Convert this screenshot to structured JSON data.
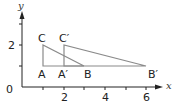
{
  "diagram": {
    "type": "coordinate-geometry",
    "axes": {
      "x_label": "x",
      "y_label": "y",
      "origin_label": "0",
      "x_ticks": [
        "2",
        "4",
        "6"
      ],
      "y_ticks": [
        "2"
      ]
    },
    "points": {
      "A": {
        "label": "A",
        "x": 1,
        "y": 1
      },
      "B": {
        "label": "B",
        "x": 3,
        "y": 1
      },
      "C": {
        "label": "C",
        "x": 1,
        "y": 2
      },
      "A_prime": {
        "label": "A′",
        "x": 2,
        "y": 1
      },
      "B_prime": {
        "label": "B′",
        "x": 6,
        "y": 1
      },
      "C_prime": {
        "label": "C′",
        "x": 2,
        "y": 2
      }
    },
    "triangles": [
      {
        "name": "ABC",
        "vertices": [
          "A",
          "B",
          "C"
        ]
      },
      {
        "name": "A′B′C′",
        "vertices": [
          "A_prime",
          "B_prime",
          "C_prime"
        ]
      }
    ],
    "colors": {
      "axis": "#222222",
      "shape": "#8a8a8a"
    }
  }
}
